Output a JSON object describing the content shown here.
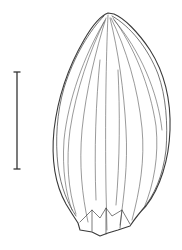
{
  "figure": {
    "line_color": "#3a3a3a",
    "background": "#ffffff",
    "scale_bar": {
      "x": 17,
      "y_top": 72,
      "y_bottom": 169,
      "color": "#333333"
    }
  }
}
